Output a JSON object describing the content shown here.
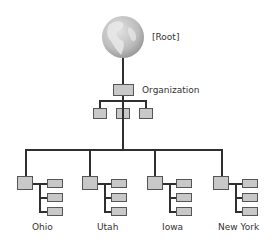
{
  "diagram": {
    "root": {
      "label": "[Root]",
      "icon": "globe-icon"
    },
    "organization": {
      "label": "Organization",
      "children_count": 3
    },
    "branches": [
      {
        "label": "Ohio",
        "children_count": 3
      },
      {
        "label": "Utah",
        "children_count": 3
      },
      {
        "label": "Iowa",
        "children_count": 3
      },
      {
        "label": "New York",
        "children_count": 3
      }
    ],
    "colors": {
      "line": "#2f2f2f",
      "box_fill": "#c8c8c8",
      "box_border": "#555555",
      "globe": "#b8b8b8",
      "text": "#333333"
    }
  }
}
